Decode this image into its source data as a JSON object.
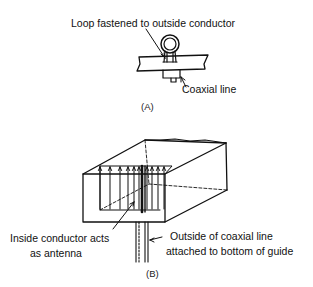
{
  "figure_a": {
    "caption": "(A)",
    "labels": {
      "loop": "Loop fastened to outside conductor",
      "coax": "Coaxial line"
    }
  },
  "figure_b": {
    "caption": "(B)",
    "labels": {
      "inside_line1": "Inside conductor acts",
      "inside_line2": "as antenna",
      "outside_line1": "Outside of coaxial line",
      "outside_line2": "attached to bottom of guide"
    }
  },
  "colors": {
    "ink": "#111111",
    "background": "#ffffff"
  }
}
